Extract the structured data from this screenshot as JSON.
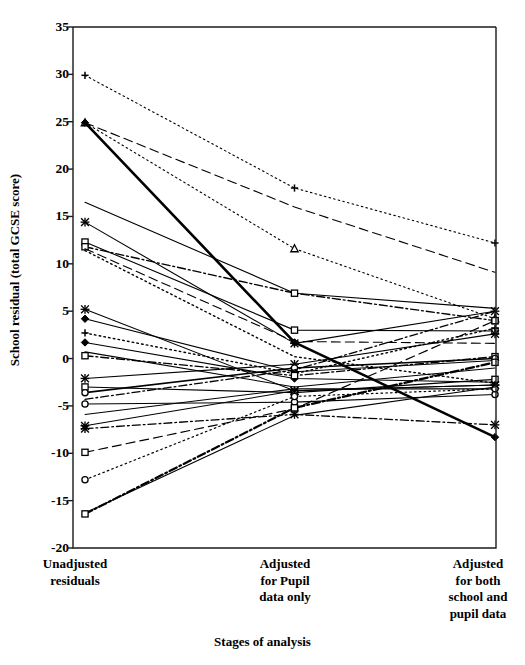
{
  "chart_data": {
    "type": "line",
    "title": "",
    "xlabel": "Stages of analysis",
    "ylabel": "School residual (total GCSE score)",
    "categories": [
      "Unadjusted\nresiduals",
      "Adjusted\nfor Pupil\ndata only",
      "Adjusted\nfor both\nschool and\npupil data"
    ],
    "x": [
      0,
      1,
      2
    ],
    "ylim": [
      -20,
      35
    ],
    "yticks": [
      35,
      30,
      25,
      20,
      15,
      10,
      5,
      0,
      -5,
      -10,
      -15,
      -20
    ],
    "ytick_labels": [
      "35",
      "30",
      "25",
      "20",
      "15",
      "10",
      "5",
      "0",
      "-5",
      "-10",
      "-15",
      "-20"
    ],
    "grid": false,
    "legend": false,
    "axis_color": "#000000",
    "line_color": "#000000",
    "series": [
      {
        "name": "School 1",
        "values": [
          29.9,
          18.0,
          12.2
        ],
        "style": "dotted",
        "marker": "plus",
        "width": 1.1
      },
      {
        "name": "School 2",
        "values": [
          24.9,
          16.0,
          9.1
        ],
        "style": "dashed",
        "marker": "none",
        "width": 1.1
      },
      {
        "name": "School 3",
        "values": [
          24.9,
          11.6,
          4.2
        ],
        "style": "dotted",
        "marker": "triangle",
        "width": 1.1
      },
      {
        "name": "School 4",
        "values": [
          24.9,
          1.7,
          -8.3
        ],
        "style": "solid",
        "marker": "diamond",
        "width": 2.6
      },
      {
        "name": "School 5",
        "values": [
          16.5,
          6.9,
          5.3
        ],
        "style": "solid",
        "marker": "none",
        "width": 1.1
      },
      {
        "name": "School 6",
        "values": [
          14.4,
          1.6,
          5.0
        ],
        "style": "solid",
        "marker": "asterisk",
        "width": 1.1
      },
      {
        "name": "School 7",
        "values": [
          12.3,
          3.0,
          2.9
        ],
        "style": "solid",
        "marker": "square",
        "width": 1.1
      },
      {
        "name": "School 8",
        "values": [
          11.8,
          6.9,
          4.0
        ],
        "style": "dashdot",
        "marker": "square",
        "width": 1.4
      },
      {
        "name": "School 9",
        "values": [
          11.6,
          1.8,
          1.6
        ],
        "style": "dashed",
        "marker": "none",
        "width": 1.1
      },
      {
        "name": "School 10",
        "values": [
          11.4,
          0.2,
          -2.6
        ],
        "style": "dotted",
        "marker": "none",
        "width": 1.4
      },
      {
        "name": "School 11",
        "values": [
          5.2,
          -3.4,
          -2.8
        ],
        "style": "solid",
        "marker": "asterisk",
        "width": 1.1
      },
      {
        "name": "School 12",
        "values": [
          4.2,
          -1.4,
          -0.2
        ],
        "style": "solid",
        "marker": "diamond",
        "width": 1.1
      },
      {
        "name": "School 13",
        "values": [
          2.7,
          -1.6,
          3.2
        ],
        "style": "dotted",
        "marker": "plus",
        "width": 1.4
      },
      {
        "name": "School 14",
        "values": [
          1.7,
          -2.1,
          -2.5
        ],
        "style": "solid",
        "marker": "diamond",
        "width": 1.1
      },
      {
        "name": "School 15",
        "values": [
          0.7,
          -3.0,
          -1.0
        ],
        "style": "solid",
        "marker": "none",
        "width": 1.1
      },
      {
        "name": "School 16",
        "values": [
          0.3,
          -1.8,
          0.2
        ],
        "style": "dashdot",
        "marker": "square",
        "width": 1.4
      },
      {
        "name": "School 17",
        "values": [
          -2.1,
          -0.6,
          2.6
        ],
        "style": "solid",
        "marker": "asterisk",
        "width": 1.1
      },
      {
        "name": "School 18",
        "values": [
          -3.0,
          -3.6,
          -2.2
        ],
        "style": "solid",
        "marker": "square",
        "width": 1.1
      },
      {
        "name": "School 19",
        "values": [
          -3.6,
          -1.0,
          0.0
        ],
        "style": "solid",
        "marker": "circle",
        "width": 1.6
      },
      {
        "name": "School 20",
        "values": [
          -4.3,
          -1.2,
          5.0
        ],
        "style": "dashdot",
        "marker": "none",
        "width": 1.3
      },
      {
        "name": "School 21",
        "values": [
          -4.8,
          -4.6,
          -3.8
        ],
        "style": "solid",
        "marker": "circle",
        "width": 1.1
      },
      {
        "name": "School 22",
        "values": [
          -5.9,
          -3.2,
          -3.2
        ],
        "style": "solid",
        "marker": "none",
        "width": 1.1
      },
      {
        "name": "School 23",
        "values": [
          -7.1,
          -3.4,
          -2.8
        ],
        "style": "solid",
        "marker": "asterisk",
        "width": 1.1
      },
      {
        "name": "School 24",
        "values": [
          -7.4,
          -5.9,
          -7.0
        ],
        "style": "dashdot",
        "marker": "asterisk",
        "width": 1.3
      },
      {
        "name": "School 25",
        "values": [
          -9.9,
          -5.3,
          4.0
        ],
        "style": "dashed",
        "marker": "square",
        "width": 1.2
      },
      {
        "name": "School 26",
        "values": [
          -12.8,
          -4.0,
          -3.2
        ],
        "style": "dotted",
        "marker": "circle",
        "width": 1.2
      },
      {
        "name": "School 27",
        "values": [
          -16.3,
          -6.0,
          -3.0
        ],
        "style": "solid",
        "marker": "none",
        "width": 1.1
      },
      {
        "name": "School 28",
        "values": [
          -16.4,
          -5.2,
          -0.4
        ],
        "style": "dashdot",
        "marker": "square",
        "width": 2.2
      }
    ]
  },
  "axis": {
    "ylabel_text": "School residual (total GCSE score)",
    "xlabel_text": "Stages of analysis"
  }
}
